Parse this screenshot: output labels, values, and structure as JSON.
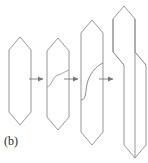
{
  "figure": {
    "label": "(b)",
    "type": "schematic-diagram",
    "background_color": "#ffffff",
    "stroke_color": "#8a8a8a",
    "stroke_color_dark": "#6e6e6e",
    "stroke_width": 0.9,
    "stage_count": 4,
    "arrow_count": 3,
    "stages": [
      {
        "name": "stage-1-undeformed-crystal",
        "description": "elongated hexagon with pointed top and bottom, no slip line",
        "outline": "20,37 31,50 31,112 20,125 9,112 9,50",
        "has_slip_curve": false
      },
      {
        "name": "stage-2-nucleated-slip",
        "description": "same hexagon with a faint S-shaped slip curve beginning across the middle",
        "outline": "58,38 69,51 69,117 58,130 47,117 47,51",
        "has_slip_curve": true,
        "slip_curve": "M47,87 C52,86 53,76 58,75 C62,74 64,72 69,70"
      },
      {
        "name": "stage-3-propagating-slip",
        "description": "taller hexagon with a pronounced S-shaped slip curve sweeping the full width",
        "outline": "92,20 103,33 103,132 92,145 81,132 81,33",
        "has_slip_curve": true,
        "slip_curve": "M81,100 C88,100 84,86 90,76 C94,69 97,66 103,63"
      },
      {
        "name": "stage-4-sheared-crystal",
        "description": "crystal after slip: upper half displaced left of lower half, joined by inclined slip planes",
        "upper_half": "124,6 135,19 135,52 113,52 113,19",
        "lower_half": "135,52 146,65 146,145 135,158 124,145 124,65 113,52",
        "has_slip_curve": false,
        "slip_plane_color": "#6e6e6e"
      }
    ],
    "arrows": [
      {
        "name": "arrow-stage1-to-stage2",
        "x1": 29,
        "y1": 79,
        "x2": 44,
        "y2": 79
      },
      {
        "name": "arrow-stage2-to-stage3",
        "x1": 64,
        "y1": 79,
        "x2": 79,
        "y2": 79
      },
      {
        "name": "arrow-stage3-to-stage4",
        "x1": 99,
        "y1": 79,
        "x2": 114,
        "y2": 79
      }
    ]
  }
}
